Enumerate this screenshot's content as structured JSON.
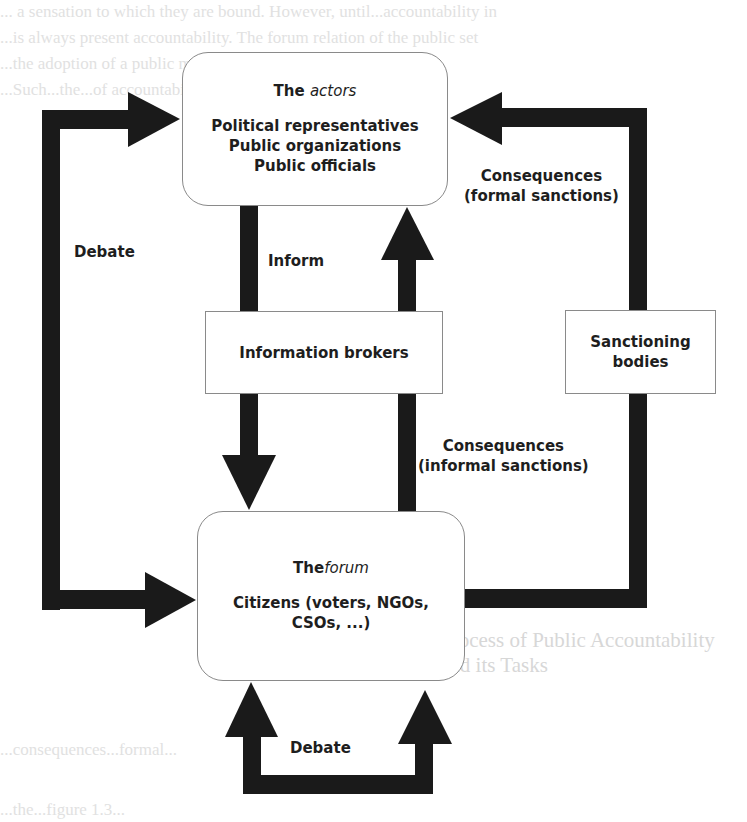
{
  "background_text": {
    "lines": [
      "... a sensation to which they are bound. However, until...accountability in",
      "...is always present accountability. The forum relation of the public set",
      "...the adoption of a public management...public...[21] elements",
      "...Such...the...of accountability...[22]...the field entities can",
      "...as...of accountability...[21]...multiple...formal...",
      "...the the principle-agent...their...",
      "...giving forum, the",
      "...the...voters...[1]...15",
      "...public accountability...ownership...",
      "...public officials...represent...",
      "...consequences...formal...",
      "...informal sanctions...",
      "...the...figure 1.3..."
    ],
    "heading": "Process of Public Accountability and its Tasks"
  },
  "nodes": {
    "actors": {
      "title_prefix": "The",
      "title_italic": "actors",
      "lines": [
        "Political representatives",
        "Public organizations",
        "Public officials"
      ]
    },
    "information_brokers": {
      "label": "Information brokers"
    },
    "sanctioning_bodies": {
      "lines": [
        "Sanctioning",
        "bodies"
      ]
    },
    "forum": {
      "title_prefix": "The",
      "title_italic": "forum",
      "lines": [
        "Citizens (voters, NGOs,",
        "CSOs, ...)"
      ]
    }
  },
  "edges": {
    "debate_left": "Debate",
    "inform": "Inform",
    "formal_consequences": [
      "Consequences",
      "(formal sanctions)"
    ],
    "informal_consequences": [
      "Consequences",
      "(informal sanctions)"
    ],
    "debate_bottom": "Debate"
  },
  "colors": {
    "arrow": "#1a1a1a",
    "box_border": "#8a8a8a",
    "text": "#1e1e1e"
  }
}
